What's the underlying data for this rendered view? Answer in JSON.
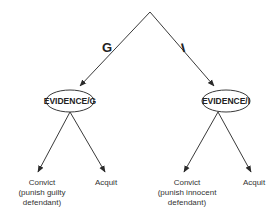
{
  "diagram": {
    "type": "decision-tree",
    "root": {
      "branches": [
        {
          "label": "G",
          "node": "EVIDENCE/G",
          "outcomes": [
            {
              "lines": [
                "Convict",
                "(punish guilty",
                "defendant)"
              ]
            },
            {
              "lines": [
                "Acquit"
              ]
            }
          ]
        },
        {
          "label": "I",
          "node": "EVIDENCE/I",
          "outcomes": [
            {
              "lines": [
                "Convict",
                "(punish innocent",
                "defendant)"
              ]
            },
            {
              "lines": [
                "Acquit"
              ]
            }
          ]
        }
      ]
    },
    "colors": {
      "line": "#3a3a3a",
      "text": "#222222",
      "background": "#ffffff"
    }
  }
}
